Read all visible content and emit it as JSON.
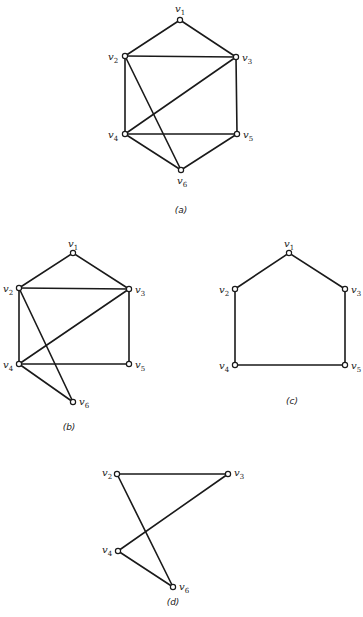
{
  "figure": {
    "graphs": [
      {
        "id": "a",
        "caption": "(a)",
        "caption_pos": [
          181,
          213
        ],
        "vertices": [
          {
            "name": "v",
            "sub": "1",
            "x": 180,
            "y": 20,
            "lx": -5,
            "ly": -8
          },
          {
            "name": "v",
            "sub": "2",
            "x": 125,
            "y": 56,
            "lx": -17,
            "ly": 4
          },
          {
            "name": "v",
            "sub": "3",
            "x": 236,
            "y": 57,
            "lx": 6,
            "ly": 4
          },
          {
            "name": "v",
            "sub": "4",
            "x": 125,
            "y": 134,
            "lx": -17,
            "ly": 4
          },
          {
            "name": "v",
            "sub": "5",
            "x": 237,
            "y": 134,
            "lx": 6,
            "ly": 4
          },
          {
            "name": "v",
            "sub": "6",
            "x": 181,
            "y": 170,
            "lx": -4,
            "ly": 14
          }
        ],
        "edges": [
          [
            0,
            1
          ],
          [
            0,
            2
          ],
          [
            1,
            2
          ],
          [
            1,
            3
          ],
          [
            1,
            5
          ],
          [
            2,
            3
          ],
          [
            2,
            4
          ],
          [
            3,
            4
          ],
          [
            3,
            5
          ],
          [
            4,
            5
          ]
        ]
      },
      {
        "id": "b",
        "caption": "(b)",
        "caption_pos": [
          69,
          430
        ],
        "vertices": [
          {
            "name": "v",
            "sub": "1",
            "x": 73,
            "y": 253,
            "lx": -5,
            "ly": -6
          },
          {
            "name": "v",
            "sub": "2",
            "x": 19,
            "y": 288,
            "lx": -16,
            "ly": 4
          },
          {
            "name": "v",
            "sub": "3",
            "x": 129,
            "y": 289,
            "lx": 6,
            "ly": 4
          },
          {
            "name": "v",
            "sub": "4",
            "x": 19,
            "y": 364,
            "lx": -16,
            "ly": 4
          },
          {
            "name": "v",
            "sub": "5",
            "x": 129,
            "y": 364,
            "lx": 6,
            "ly": 4
          },
          {
            "name": "v",
            "sub": "6",
            "x": 73,
            "y": 402,
            "lx": 6,
            "ly": 3
          }
        ],
        "edges": [
          [
            0,
            1
          ],
          [
            0,
            2
          ],
          [
            1,
            2
          ],
          [
            1,
            3
          ],
          [
            1,
            5
          ],
          [
            2,
            3
          ],
          [
            2,
            4
          ],
          [
            3,
            4
          ],
          [
            3,
            5
          ]
        ]
      },
      {
        "id": "c",
        "caption": "(c)",
        "caption_pos": [
          292,
          404
        ],
        "vertices": [
          {
            "name": "v",
            "sub": "1",
            "x": 289,
            "y": 253,
            "lx": -5,
            "ly": -6
          },
          {
            "name": "v",
            "sub": "2",
            "x": 235,
            "y": 289,
            "lx": -16,
            "ly": 4
          },
          {
            "name": "v",
            "sub": "3",
            "x": 345,
            "y": 289,
            "lx": 6,
            "ly": 4
          },
          {
            "name": "v",
            "sub": "4",
            "x": 235,
            "y": 365,
            "lx": -16,
            "ly": 4
          },
          {
            "name": "v",
            "sub": "5",
            "x": 345,
            "y": 365,
            "lx": 6,
            "ly": 4
          }
        ],
        "edges": [
          [
            0,
            1
          ],
          [
            0,
            2
          ],
          [
            1,
            3
          ],
          [
            2,
            4
          ],
          [
            3,
            4
          ]
        ]
      },
      {
        "id": "d",
        "caption": "(d)",
        "caption_pos": [
          173,
          605
        ],
        "vertices": [
          {
            "name": "v",
            "sub": "2",
            "x": 117,
            "y": 474,
            "lx": -15,
            "ly": 2
          },
          {
            "name": "v",
            "sub": "3",
            "x": 228,
            "y": 474,
            "lx": 6,
            "ly": 2
          },
          {
            "name": "v",
            "sub": "4",
            "x": 118,
            "y": 551,
            "lx": -16,
            "ly": 2
          },
          {
            "name": "v",
            "sub": "6",
            "x": 173,
            "y": 587,
            "lx": 6,
            "ly": 3
          }
        ],
        "edges": [
          [
            0,
            1
          ],
          [
            0,
            3
          ],
          [
            1,
            2
          ],
          [
            2,
            3
          ]
        ]
      }
    ]
  }
}
